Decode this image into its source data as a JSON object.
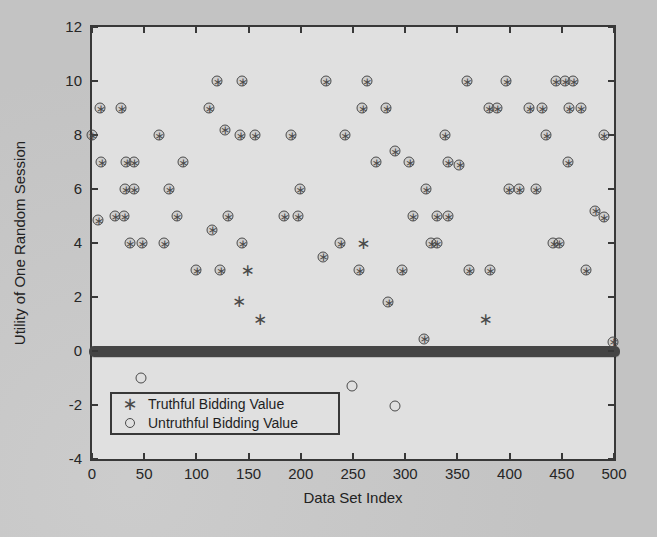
{
  "chart_data": {
    "type": "scatter",
    "title": "",
    "xlabel": "Data Set Index",
    "ylabel": "Utility of One Random Session",
    "xlim": [
      0,
      500
    ],
    "ylim": [
      -4,
      12
    ],
    "x_ticks": [
      0,
      50,
      100,
      150,
      200,
      250,
      300,
      350,
      400,
      450,
      500
    ],
    "y_ticks": [
      -4,
      -2,
      0,
      2,
      4,
      6,
      8,
      10,
      12
    ],
    "grid": false,
    "legend": {
      "position": "south-west",
      "entries": [
        {
          "marker": "asterisk",
          "label": "Truthful Bidding Value"
        },
        {
          "marker": "circle",
          "label": "Untruthful Bidding Value"
        }
      ]
    },
    "icons": {
      "asterisk_marker": "∗",
      "circle_marker": "open-circle"
    },
    "colors": {
      "marker": "#4a4a4a",
      "axis": "#383838",
      "plot_background": "#e0e0e0",
      "page_background": "#c9c9c9",
      "band": "#454545"
    },
    "zero_band": {
      "y": 0,
      "x_start": 0,
      "x_end": 500,
      "description": "dense overlapping asterisk+circle markers at utility 0 for nearly all 500 data set indices"
    },
    "coincident_points": [
      [
        120,
        10
      ],
      [
        144,
        10
      ],
      [
        224,
        10
      ],
      [
        263,
        10
      ],
      [
        359,
        10
      ],
      [
        397,
        10
      ],
      [
        444,
        10
      ],
      [
        453,
        10
      ],
      [
        461,
        10
      ],
      [
        8,
        9
      ],
      [
        28,
        9
      ],
      [
        112,
        9
      ],
      [
        259,
        9
      ],
      [
        282,
        9
      ],
      [
        380,
        9
      ],
      [
        388,
        9
      ],
      [
        419,
        9
      ],
      [
        431,
        9
      ],
      [
        457,
        9
      ],
      [
        468,
        9
      ],
      [
        0,
        8
      ],
      [
        64,
        8
      ],
      [
        127,
        8.2
      ],
      [
        142,
        8
      ],
      [
        156,
        8
      ],
      [
        191,
        8
      ],
      [
        242,
        8
      ],
      [
        338,
        8
      ],
      [
        435,
        8
      ],
      [
        490,
        8
      ],
      [
        9,
        7
      ],
      [
        33,
        7
      ],
      [
        40,
        7
      ],
      [
        87,
        7
      ],
      [
        272,
        7
      ],
      [
        290,
        7.4
      ],
      [
        304,
        7
      ],
      [
        341,
        7
      ],
      [
        352,
        6.9
      ],
      [
        456,
        7
      ],
      [
        32,
        6
      ],
      [
        40,
        6
      ],
      [
        74,
        6
      ],
      [
        199,
        6
      ],
      [
        320,
        6
      ],
      [
        399,
        6
      ],
      [
        409,
        6
      ],
      [
        425,
        6
      ],
      [
        6,
        4.85
      ],
      [
        22,
        5
      ],
      [
        31,
        5
      ],
      [
        81,
        5
      ],
      [
        115,
        4.5
      ],
      [
        130,
        5
      ],
      [
        184,
        5
      ],
      [
        197,
        5
      ],
      [
        307,
        5
      ],
      [
        330,
        5
      ],
      [
        341,
        5
      ],
      [
        482,
        5.2
      ],
      [
        490,
        4.95
      ],
      [
        36,
        4
      ],
      [
        48,
        4
      ],
      [
        69,
        4
      ],
      [
        144,
        4
      ],
      [
        238,
        4
      ],
      [
        325,
        4
      ],
      [
        330,
        4
      ],
      [
        442,
        4
      ],
      [
        447,
        4
      ],
      [
        100,
        3
      ],
      [
        123,
        3
      ],
      [
        221,
        3.5
      ],
      [
        256,
        3
      ],
      [
        297,
        3
      ],
      [
        361,
        3
      ],
      [
        381,
        3
      ],
      [
        473,
        3
      ],
      [
        284,
        1.8
      ],
      [
        318,
        0.45
      ],
      [
        499,
        0.35
      ]
    ],
    "truthful_only_points": [
      [
        141,
        1.85
      ],
      [
        149,
        3
      ],
      [
        161,
        1.2
      ],
      [
        260,
        4
      ],
      [
        377,
        1.2
      ]
    ],
    "untruthful_only_points": [
      [
        47,
        -1
      ],
      [
        249,
        -1.3
      ],
      [
        290,
        -2.05
      ]
    ]
  }
}
